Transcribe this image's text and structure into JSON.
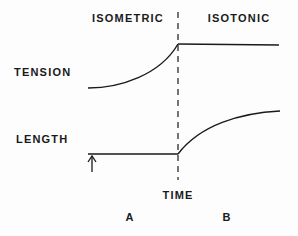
{
  "diagram": {
    "phases": {
      "left": "ISOMETRIC",
      "right": "ISOTONIC"
    },
    "row_labels": {
      "tension": "TENSION",
      "length": "LENGTH"
    },
    "axis": {
      "time": "TIME"
    },
    "panel_labels": {
      "a": "A",
      "b": "B"
    },
    "traces": {
      "tension": "Rises during isometric phase, then constant during isotonic phase",
      "length": "Constant during isometric phase, then increases during isotonic phase"
    },
    "markers": {
      "stimulus_arrow": "up-arrow",
      "phase_divider": "dashed-vertical-line"
    },
    "colors": {
      "ink": "#1a1a1a",
      "background": "#fdfdfd"
    }
  }
}
